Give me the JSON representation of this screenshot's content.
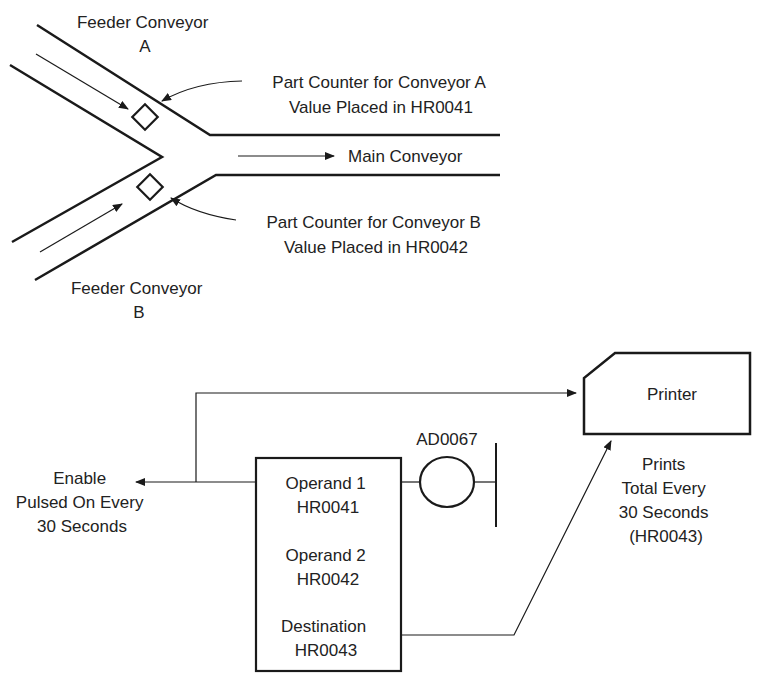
{
  "conveyor": {
    "feeder_a": [
      "Feeder Conveyor",
      "A"
    ],
    "feeder_b": [
      "Feeder Conveyor",
      "B"
    ],
    "main": "Main Conveyor",
    "counter_a": [
      "Part Counter for Conveyor A",
      "Value Placed in HR0041"
    ],
    "counter_b": [
      "Part Counter for Conveyor B",
      "Value Placed in HR0042"
    ]
  },
  "ladder": {
    "enable": [
      "Enable",
      "Pulsed On Every",
      "30 Seconds"
    ],
    "coil": "AD0067",
    "block": {
      "operand1": [
        "Operand 1",
        "HR0041"
      ],
      "operand2": [
        "Operand 2",
        "HR0042"
      ],
      "destination": [
        "Destination",
        "HR0043"
      ]
    },
    "printer": "Printer",
    "printer_note": [
      "Prints",
      "Total Every",
      "30 Seconds",
      "(HR0043)"
    ]
  },
  "colors": {
    "line": "#1a1a1a",
    "text": "#222222"
  }
}
